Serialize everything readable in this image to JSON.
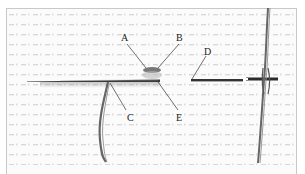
{
  "figure": {
    "labels": [
      {
        "id": "A",
        "text": "A",
        "x": 121,
        "y": 33
      },
      {
        "id": "B",
        "text": "B",
        "x": 176,
        "y": 33
      },
      {
        "id": "C",
        "text": "C",
        "x": 127,
        "y": 113
      },
      {
        "id": "D",
        "text": "D",
        "x": 204,
        "y": 47
      },
      {
        "id": "E",
        "text": "E",
        "x": 176,
        "y": 113
      }
    ],
    "colors": {
      "fabric_bg": "#fbfbfb",
      "fabric_dots": "#d4d4d4",
      "needle": "#3a3a3a",
      "thread": "#555555",
      "leader_line": "#333333",
      "frame_border": "#c8c8c8"
    }
  }
}
